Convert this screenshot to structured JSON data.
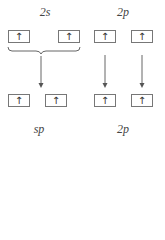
{
  "top": {
    "label_2s": "2s",
    "label_2p": "2p",
    "boxes": [
      "↑",
      "↑",
      "↑",
      "↑"
    ]
  },
  "bottom": {
    "label_sp": "sp",
    "label_2p": "2p",
    "boxes": [
      "↑",
      "↑",
      "↑",
      "↑"
    ]
  }
}
